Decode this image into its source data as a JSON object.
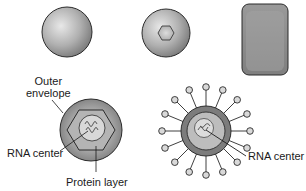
{
  "diagram": {
    "top_row": [
      {
        "id": "sphere",
        "shape": "sphere"
      },
      {
        "id": "sphere-hexagon",
        "shape": "sphere with hexagonal core"
      },
      {
        "id": "rounded-rect",
        "shape": "rounded rectangle"
      }
    ],
    "bottom_left": {
      "labels": {
        "outer_envelope_line1": "Outer",
        "outer_envelope_line2": "envelope",
        "rna_center": "RNA center",
        "protein_layer": "Protein layer"
      }
    },
    "bottom_right": {
      "spike_count": 16,
      "labels": {
        "rna_center": "RNA center"
      }
    },
    "colors": {
      "outline": "#2b2b2b",
      "sphere_light": "#e6e6e6",
      "sphere_dark": "#8a8a8a",
      "envelope": "#9c9c9c",
      "protein": "#b8b8b8",
      "rna_core": "#d6d6d6",
      "rect_fill": "#8c8c8c",
      "knob": "#d9d9d9"
    }
  }
}
